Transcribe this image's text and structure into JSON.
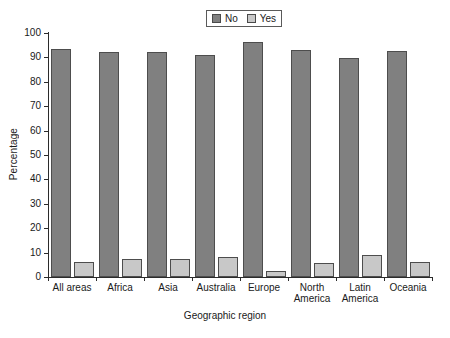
{
  "chart_data": {
    "type": "bar",
    "title": "",
    "xlabel": "Geographic region",
    "ylabel": "Percentage",
    "ylim": [
      0,
      100
    ],
    "ytick_step": 10,
    "grid": false,
    "legend_position": "top-center",
    "categories": [
      "All areas",
      "Africa",
      "Asia",
      "Australia",
      "Europe",
      "North\nAmerica",
      "Latin\nAmerica",
      "Oceania"
    ],
    "ytick_labels": [
      "0",
      "10",
      "20",
      "30",
      "40",
      "50",
      "60",
      "70",
      "80",
      "90",
      "100"
    ],
    "series": [
      {
        "name": "No",
        "color": "#808080",
        "values": [
          93.5,
          92.1,
          92.2,
          91.0,
          96.5,
          93.2,
          89.6,
          92.8
        ]
      },
      {
        "name": "Yes",
        "color": "#c8c8c8",
        "values": [
          6.3,
          7.5,
          7.3,
          8.3,
          2.6,
          5.9,
          9.2,
          6.1
        ]
      }
    ]
  },
  "legend": {
    "entries": [
      {
        "label": "No"
      },
      {
        "label": "Yes"
      }
    ]
  },
  "colors": {
    "no": "#808080",
    "yes": "#c8c8c8",
    "axis": "#2b2b2b",
    "bar_border": "#4d4d4d",
    "background": "#ffffff"
  }
}
